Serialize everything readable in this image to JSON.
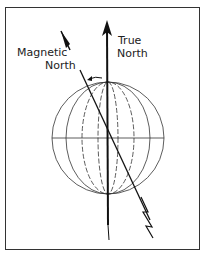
{
  "diagram": {
    "labels": {
      "true_north_line1": "True",
      "true_north_line2": "North",
      "magnetic_north_line1": "Magnetic",
      "magnetic_north_line2": "North"
    },
    "colors": {
      "line": "#222222",
      "background": "#ffffff"
    }
  }
}
